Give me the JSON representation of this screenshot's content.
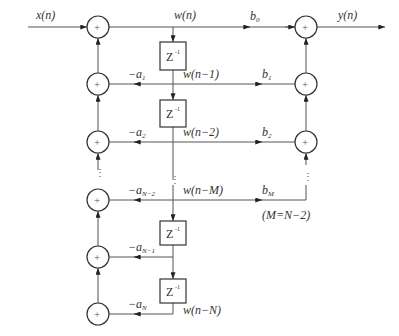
{
  "diagram": {
    "type": "signal-flow-direct-form-II",
    "input_label": "x(n)",
    "output_label": "y(n)",
    "adder_symbol": "+",
    "delay_label": "Z",
    "delay_exp": "-1",
    "nodes": {
      "w0": "w(n)",
      "w1": "w(n−1)",
      "w2": "w(n−2)",
      "wM": "w(n−M)",
      "wN": "w(n−N)"
    },
    "feedback": {
      "a1": {
        "base": "−a",
        "sub": "1"
      },
      "a2": {
        "base": "−a",
        "sub": "2"
      },
      "aN2": {
        "base": "−a",
        "sub": "N−2"
      },
      "aN1": {
        "base": "−a",
        "sub": "N−1"
      },
      "aN": {
        "base": "−a",
        "sub": "N"
      }
    },
    "feedforward": {
      "b0": {
        "base": "b",
        "sub": "0"
      },
      "b1": {
        "base": "b",
        "sub": "1"
      },
      "b2": {
        "base": "b",
        "sub": "2"
      },
      "bM": {
        "base": "b",
        "sub": "M"
      }
    },
    "note": "(M=N−2)",
    "ellipsis": "⋮"
  }
}
